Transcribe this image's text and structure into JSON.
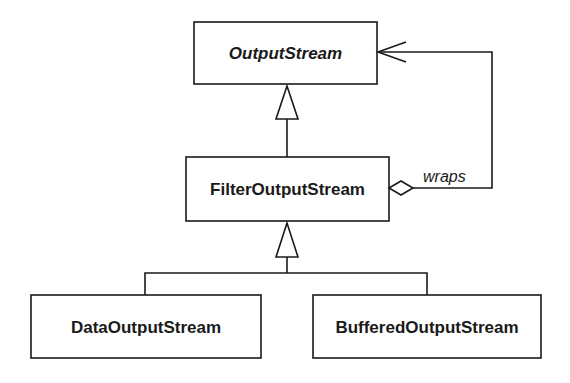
{
  "diagram": {
    "type": "uml-class-diagram",
    "classes": [
      {
        "id": "output_stream",
        "name": "OutputStream",
        "abstract": true
      },
      {
        "id": "filter_output_stream",
        "name": "FilterOutputStream",
        "abstract": false
      },
      {
        "id": "data_output_stream",
        "name": "DataOutputStream",
        "abstract": false
      },
      {
        "id": "buffered_output_stream",
        "name": "BufferedOutputStream",
        "abstract": false
      }
    ],
    "relationships": [
      {
        "type": "generalization",
        "from": "FilterOutputStream",
        "to": "OutputStream"
      },
      {
        "type": "generalization",
        "from": "DataOutputStream",
        "to": "FilterOutputStream"
      },
      {
        "type": "generalization",
        "from": "BufferedOutputStream",
        "to": "FilterOutputStream"
      },
      {
        "type": "aggregation",
        "from": "FilterOutputStream",
        "to": "OutputStream",
        "label": "wraps"
      }
    ],
    "labels": {
      "output_stream": "OutputStream",
      "filter_output_stream": "FilterOutputStream",
      "data_output_stream": "DataOutputStream",
      "buffered_output_stream": "BufferedOutputStream",
      "wraps": "wraps"
    },
    "colors": {
      "stroke": "#1a1a1a",
      "fill": "#ffffff",
      "background": "#ffffff"
    }
  }
}
